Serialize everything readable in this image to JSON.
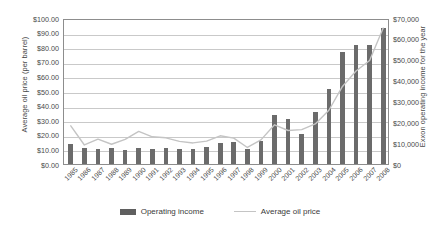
{
  "chart_data": {
    "type": "bar",
    "title": "",
    "xlabel": "",
    "ylabel": "Average oil price (per barrel)",
    "y2label": "Exxon operating income for the year",
    "grid": true,
    "legend_position": "bottom",
    "categories": [
      "1985",
      "1986",
      "1987",
      "1988",
      "1989",
      "1990",
      "1991",
      "1992",
      "1993",
      "1994",
      "1995",
      "1996",
      "1997",
      "1998",
      "1999",
      "2000",
      "2001",
      "2002",
      "2003",
      "2004",
      "2005",
      "2006",
      "2007",
      "2008"
    ],
    "ylim": [
      0,
      100
    ],
    "y2lim": [
      0,
      70000
    ],
    "yticks": [
      "$0.00",
      "$10.00",
      "$20.00",
      "$30.00",
      "$40.00",
      "$50.00",
      "$60.00",
      "$70.00",
      "$80.00",
      "$90.00",
      "$100.00"
    ],
    "ytick_values": [
      0,
      10,
      20,
      30,
      40,
      50,
      60,
      70,
      80,
      90,
      100
    ],
    "y2ticks": [
      "$0",
      "$10,000",
      "$20,000",
      "$30,000",
      "$40,000",
      "$50,000",
      "$60,000",
      "$70,000"
    ],
    "y2tick_values": [
      0,
      10000,
      20000,
      30000,
      40000,
      50000,
      60000,
      70000
    ],
    "series": [
      {
        "name": "Operating income",
        "type": "bar",
        "axis": "right",
        "color": "#6b6b6b",
        "values": [
          9600,
          7600,
          7200,
          7500,
          6600,
          7500,
          7300,
          7500,
          7300,
          7200,
          8300,
          10100,
          10400,
          7200,
          10800,
          23300,
          21600,
          14300,
          24700,
          36100,
          53500,
          57000,
          57000,
          65400
        ]
      },
      {
        "name": "Average oil price",
        "type": "line",
        "axis": "left",
        "color": "#c4c4c4",
        "values": [
          27.5,
          14.4,
          18.4,
          14.9,
          18.2,
          23.7,
          20.0,
          19.3,
          16.9,
          15.8,
          17.0,
          20.7,
          19.1,
          12.7,
          17.9,
          28.2,
          24.3,
          24.9,
          28.8,
          38.2,
          54.5,
          65.1,
          72.3,
          94.5
        ]
      }
    ]
  },
  "legend": {
    "items": [
      {
        "label": "Operating income",
        "marker": "bar-swatch",
        "color": "#5f5f5f"
      },
      {
        "label": "Average oil price",
        "marker": "line-swatch",
        "color": "#c4c4c4"
      }
    ]
  }
}
